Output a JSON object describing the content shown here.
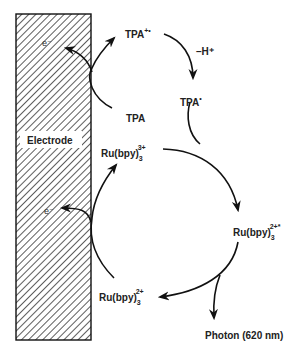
{
  "diagram": {
    "electrode": {
      "label": "Electrode",
      "hatch_color": "#333333",
      "fill": "#ffffff"
    },
    "nodes": {
      "tpa_radical_cation": {
        "base": "TPA",
        "sup": "+•"
      },
      "tpa": {
        "base": "TPA"
      },
      "tpa_radical": {
        "base": "TPA",
        "sup": "•"
      },
      "ru3": {
        "base": "Ru(bpy)",
        "sub": "3",
        "sup": "3+"
      },
      "ru2_excited": {
        "base": "Ru(bpy)",
        "sub": "3",
        "sup": "2+*"
      },
      "ru2": {
        "base": "Ru(bpy)",
        "sub": "3",
        "sup": "2+"
      },
      "photon": {
        "label": "Photon (620 nm)"
      }
    },
    "electron_labels": [
      "e⁻",
      "e⁻"
    ],
    "deprotonation_label": "–H⁺",
    "edges": [
      {
        "from": "TPA",
        "to": "TPA+•",
        "via": "electrode oxidation (e⁻ to electrode)"
      },
      {
        "from": "TPA+•",
        "to": "TPA•",
        "label": "–H⁺"
      },
      {
        "from": "TPA•",
        "to": "Ru(bpy)3 2+*",
        "merges_with": "Ru(bpy)3 3+"
      },
      {
        "from": "Ru(bpy)3 3+",
        "to": "Ru(bpy)3 2+*"
      },
      {
        "from": "Ru(bpy)3 2+*",
        "to": "Ru(bpy)3 2+"
      },
      {
        "from": "Ru(bpy)3 2+*",
        "to": "Photon (620 nm)"
      },
      {
        "from": "Ru(bpy)3 2+",
        "to": "Ru(bpy)3 3+",
        "via": "electrode oxidation (e⁻ to electrode)"
      }
    ]
  }
}
